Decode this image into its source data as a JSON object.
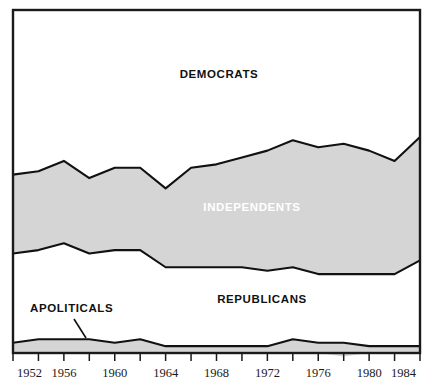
{
  "chart_data": {
    "type": "area",
    "title": "",
    "subtitle": "",
    "xlabel": "",
    "ylabel": "",
    "xlim": [
      1952,
      1984
    ],
    "ylim": [
      0,
      100
    ],
    "grid": false,
    "legend_position": "inline-labels",
    "stacked": true,
    "stack_order_top_to_bottom": [
      "Democrats",
      "Independents",
      "Republicans",
      "Apoliticals"
    ],
    "x": [
      1952,
      1954,
      1956,
      1958,
      1960,
      1962,
      1964,
      1966,
      1968,
      1970,
      1972,
      1974,
      1976,
      1978,
      1980,
      1982,
      1984
    ],
    "series": [
      {
        "name": "Democrats",
        "fill": "white",
        "values": [
          48,
          47,
          44,
          49,
          46,
          46,
          52,
          46,
          45,
          43,
          41,
          38,
          40,
          39,
          41,
          44,
          37
        ]
      },
      {
        "name": "Independents",
        "fill": "gray",
        "values": [
          23,
          23,
          24,
          22,
          24,
          24,
          23,
          29,
          30,
          32,
          35,
          37,
          37,
          38,
          36,
          33,
          36
        ]
      },
      {
        "name": "Republicans",
        "fill": "white",
        "values": [
          26,
          26,
          28,
          25,
          27,
          26,
          23,
          23,
          23,
          23,
          22,
          21,
          20,
          20,
          21,
          21,
          25
        ]
      },
      {
        "name": "Apoliticals",
        "fill": "gray",
        "values": [
          3,
          4,
          4,
          4,
          3,
          4,
          2,
          2,
          2,
          2,
          2,
          4,
          3,
          4,
          2,
          2,
          2
        ]
      }
    ],
    "band_labels": [
      {
        "text": "DEMOCRATS",
        "series": "Democrats",
        "color": "#111111"
      },
      {
        "text": "INDEPENDENTS",
        "series": "Independents",
        "color": "#ffffff"
      },
      {
        "text": "REPUBLICANS",
        "series": "Republicans",
        "color": "#111111"
      },
      {
        "text": "APOLITICALS",
        "series": "Apoliticals",
        "color": "#111111"
      }
    ],
    "xticks": [
      1952,
      1954,
      1956,
      1958,
      1960,
      1962,
      1964,
      1966,
      1968,
      1970,
      1972,
      1974,
      1976,
      1978,
      1980,
      1982,
      1984
    ],
    "xtick_labels": [
      "1952",
      "",
      "1956",
      "",
      "1960",
      "",
      "1964",
      "",
      "1968",
      "",
      "1972",
      "",
      "1976",
      "",
      "1980",
      "",
      "1984"
    ],
    "colors": {
      "band_gray": "#d5d5d5",
      "band_white": "#ffffff",
      "outline": "#111111",
      "frame": "#1a1a1a",
      "text_dark": "#111111",
      "text_light": "#ffffff",
      "background": "#ffffff"
    }
  },
  "labels": {
    "democrats": "DEMOCRATS",
    "independents": "INDEPENDENTS",
    "republicans": "REPUBLICANS",
    "apoliticals": "APOLITICALS"
  },
  "axis": {
    "ticks": [
      {
        "label": "1952"
      },
      {
        "label": ""
      },
      {
        "label": "1956"
      },
      {
        "label": ""
      },
      {
        "label": "1960"
      },
      {
        "label": ""
      },
      {
        "label": "1964"
      },
      {
        "label": ""
      },
      {
        "label": "1968"
      },
      {
        "label": ""
      },
      {
        "label": "1972"
      },
      {
        "label": ""
      },
      {
        "label": "1976"
      },
      {
        "label": ""
      },
      {
        "label": "1980"
      },
      {
        "label": ""
      },
      {
        "label": "1984"
      }
    ],
    "tick_labels_visible": [
      "1952",
      "1956",
      "1960",
      "1964",
      "1968",
      "1972",
      "1976",
      "1980",
      "1984"
    ]
  }
}
